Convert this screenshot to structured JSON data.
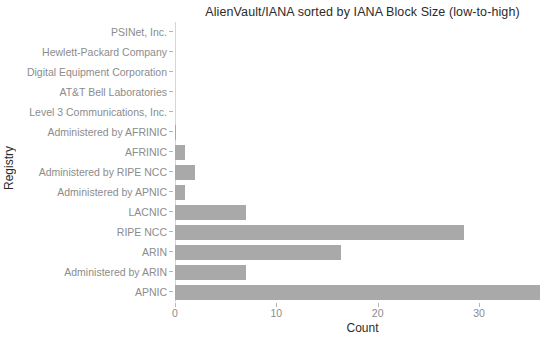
{
  "chart_data": {
    "type": "bar",
    "orientation": "horizontal",
    "title": "AlienVault/IANA sorted by IANA Block Size (low-to-high)",
    "xlabel": "Count",
    "ylabel": "Registry",
    "categories": [
      "PSINet, Inc.",
      "Hewlett-Packard Company",
      "Digital Equipment Corporation",
      "AT&T Bell Laboratories",
      "Level 3 Communications, Inc.",
      "Administered by AFRINIC",
      "AFRINIC",
      "Administered by RIPE NCC",
      "Administered by APNIC",
      "LACNIC",
      "RIPE NCC",
      "ARIN",
      "Administered by ARIN",
      "APNIC"
    ],
    "values": [
      0,
      0,
      0,
      0,
      0,
      0.1,
      1,
      2,
      1,
      7,
      28.5,
      16.4,
      7,
      36
    ],
    "xticks": [
      0,
      10,
      20,
      30
    ],
    "xlim": [
      0,
      37
    ],
    "grid": false,
    "legend": null,
    "bar_color": "#a9a9a9",
    "axis_text_color": "#8c8c8c",
    "title_color": "#2b2b2b"
  }
}
